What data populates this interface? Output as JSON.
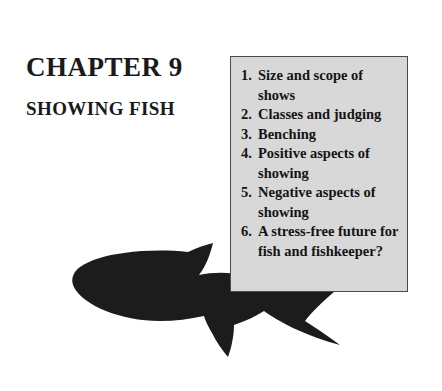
{
  "page": {
    "background_color": "#ffffff",
    "heading": {
      "chapter_label": "CHAPTER 9",
      "chapter_subtitle": "SHOWING FISH"
    },
    "contents_box": {
      "fill_color": "#d8d8d8",
      "border_color": "#4a4a4a",
      "items": [
        {
          "number": "1.",
          "text": "Size and scope of shows"
        },
        {
          "number": "2.",
          "text": "Classes and judging"
        },
        {
          "number": "3.",
          "text": "Benching"
        },
        {
          "number": "4.",
          "text": "Positive aspects of showing"
        },
        {
          "number": "5.",
          "text": "Negative aspects of showing"
        },
        {
          "number": "6.",
          "text": "A stress-free future for fish and fishkeeper?"
        }
      ]
    },
    "illustration": {
      "name": "shark-silhouette",
      "color": "#1c1c1c",
      "orientation": "facing-left"
    }
  }
}
